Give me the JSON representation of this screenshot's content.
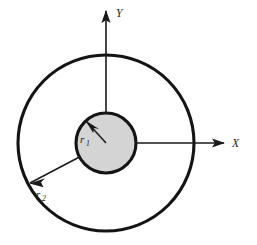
{
  "figure": {
    "background_color": "#ffffff",
    "stroke_color": "#141414",
    "inner_fill_color": "#d4d4d4",
    "width": 257,
    "height": 245
  },
  "axes": {
    "origin": {
      "x": 106,
      "y": 143
    },
    "x_axis": {
      "label": "X",
      "label_x": 232,
      "label_y": 147,
      "start_x": 106,
      "end_x": 224,
      "y": 143,
      "arrow_tip_x": 225
    },
    "y_axis": {
      "label": "Y",
      "label_x": 116,
      "label_y": 17,
      "start_y": 143,
      "end_y": 11,
      "x": 106,
      "arrow_tip_y": 10
    }
  },
  "circles": [
    {
      "name": "inner-circle",
      "cx": 106,
      "cy": 143,
      "r": 30,
      "fill": "#d4d4d4",
      "stroke": "#141414",
      "radius_symbol": "r",
      "radius_subscript": "1"
    },
    {
      "name": "outer-circle",
      "cx": 106,
      "cy": 143,
      "r": 88,
      "fill": "none",
      "stroke": "#141414",
      "radius_symbol": "r",
      "radius_subscript": "2"
    }
  ],
  "radius_arrows": [
    {
      "name": "r1-arrow",
      "symbol": "r",
      "subscript": "1",
      "from_x": 106,
      "from_y": 143,
      "to_x": 86,
      "to_y": 121,
      "label_x": 80,
      "label_y": 143,
      "sub_x": 86,
      "sub_y": 146
    },
    {
      "name": "r2-arrow",
      "symbol": "r",
      "subscript": "2",
      "from_x": 106,
      "from_y": 143,
      "to_x": 30,
      "to_y": 183,
      "label_x": 36,
      "label_y": 198,
      "sub_x": 42,
      "sub_y": 201
    }
  ]
}
